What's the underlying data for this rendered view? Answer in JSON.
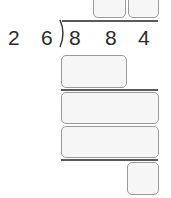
{
  "problem": {
    "type": "long-division",
    "divisor_digits": [
      "2",
      "6"
    ],
    "dividend_digits": [
      "8",
      "8",
      "4"
    ]
  },
  "answer_boxes": {
    "quotient": [
      {
        "value": ""
      },
      {
        "value": ""
      }
    ],
    "step1_product": {
      "value": ""
    },
    "step1_remainder": {
      "value": ""
    },
    "step2_product": {
      "value": ""
    },
    "final_remainder": {
      "value": ""
    }
  },
  "colors": {
    "digit": "#2b2b2b",
    "box_fill": "#f6f6f6",
    "box_border": "#9a9a9a",
    "rule": "#5a5a5a"
  }
}
